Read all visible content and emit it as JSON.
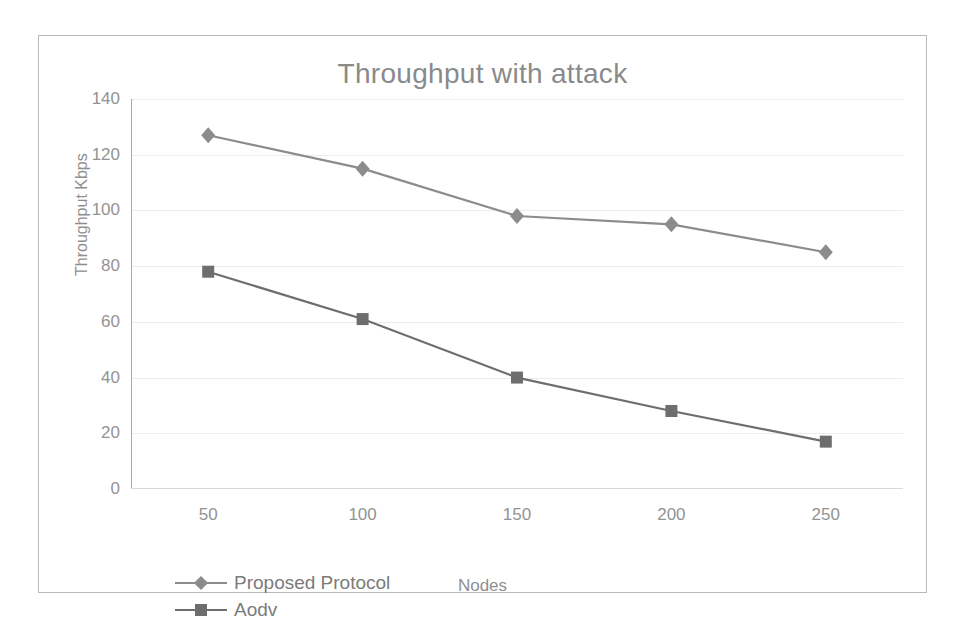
{
  "chart_data": {
    "type": "line",
    "title": "Throughput with attack",
    "xlabel": "Nodes",
    "ylabel": "Throughput Kbps",
    "categories": [
      "50",
      "100",
      "150",
      "200",
      "250"
    ],
    "x": [
      50,
      100,
      150,
      200,
      250
    ],
    "series": [
      {
        "name": "Proposed Protocol",
        "marker": "diamond",
        "color": "#8c8c8c",
        "values": [
          127,
          115,
          98,
          95,
          85
        ]
      },
      {
        "name": "Aodv",
        "marker": "square",
        "color": "#6e6e6e",
        "values": [
          78,
          61,
          40,
          28,
          17
        ]
      }
    ],
    "ylim": [
      0,
      140
    ],
    "ytick_labels": [
      "0",
      "20",
      "40",
      "60",
      "80",
      "100",
      "120",
      "140"
    ],
    "ytick_values": [
      0,
      20,
      40,
      60,
      80,
      100,
      120,
      140
    ],
    "grid": true,
    "grid_axis": "y",
    "legend_position": "bottom-left",
    "legend": [
      "Proposed Protocol",
      "Aodv"
    ]
  },
  "style": {
    "grid_color": "#ececec",
    "axis_color": "#a8a8a8",
    "text_color": "#939393",
    "title_color": "#8a8a8a",
    "frame_color": "#b9b9b9",
    "background": "#ffffff"
  }
}
